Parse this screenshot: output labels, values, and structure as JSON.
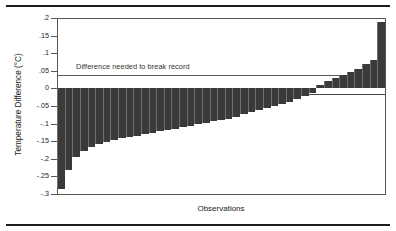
{
  "chart_data": {
    "type": "bar",
    "title": "",
    "xlabel": "Observations",
    "ylabel": "Temperature Difference (°C)",
    "ylim": [
      -0.3,
      0.2
    ],
    "yticks": [
      0.2,
      0.15,
      0.1,
      0.05,
      0,
      -0.05,
      -0.1,
      -0.15,
      -0.2,
      -0.25,
      -0.3
    ],
    "ytick_labels": [
      ".2",
      ".15",
      ".1",
      ".05",
      "0",
      "-.05",
      "-.1",
      "-.15",
      "-.2",
      "-.25",
      "-.3"
    ],
    "grid": false,
    "legend": null,
    "bar_color": "#3a3a3a",
    "annotations": [
      {
        "text": "Difference needed to break record",
        "type": "reference-line-label",
        "y": 0.05
      }
    ],
    "reference_lines": [
      {
        "y": 0.05,
        "label": "Difference needed to break record"
      },
      {
        "y": 0.0,
        "label": "zero"
      }
    ],
    "categories": [
      "1",
      "2",
      "3",
      "4",
      "5",
      "6",
      "7",
      "8",
      "9",
      "10",
      "11",
      "12",
      "13",
      "14",
      "15",
      "16",
      "17",
      "18",
      "19",
      "20",
      "21",
      "22",
      "23",
      "24",
      "25",
      "26",
      "27",
      "28",
      "29",
      "30",
      "31",
      "32",
      "33",
      "34",
      "35",
      "36",
      "37",
      "38",
      "39",
      "40",
      "41",
      "42",
      "43"
    ],
    "values": [
      -0.285,
      -0.232,
      -0.196,
      -0.178,
      -0.166,
      -0.158,
      -0.152,
      -0.148,
      -0.142,
      -0.138,
      -0.134,
      -0.13,
      -0.126,
      -0.122,
      -0.118,
      -0.114,
      -0.11,
      -0.106,
      -0.102,
      -0.098,
      -0.094,
      -0.09,
      -0.086,
      -0.08,
      -0.074,
      -0.068,
      -0.062,
      -0.056,
      -0.05,
      -0.044,
      -0.038,
      -0.03,
      -0.022,
      -0.012,
      0.01,
      0.022,
      0.03,
      0.038,
      0.046,
      0.055,
      0.068,
      0.08,
      0.19
    ]
  },
  "axes": {
    "y_title": "Temperature Difference (°C)",
    "x_title": "Observations"
  },
  "reference": {
    "label": "Difference needed to break record"
  }
}
